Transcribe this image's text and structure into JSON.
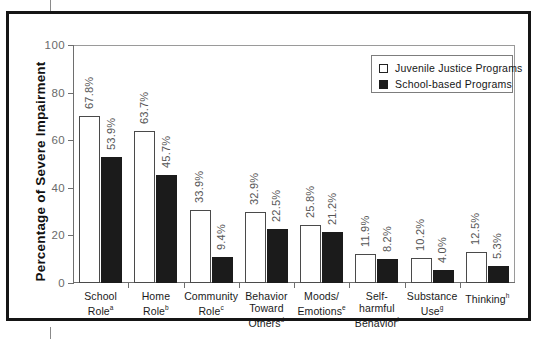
{
  "figure": {
    "ylabel": "Percentage of Severe Impairment"
  },
  "legend": {
    "items": [
      {
        "label": "Juvenile Justice Programs",
        "swatch": "hollow-square",
        "color": "#ffffff"
      },
      {
        "label": "School-based Programs",
        "swatch": "filled-square",
        "color": "#1b1b1b"
      }
    ]
  },
  "axis": {
    "yticks": [
      "0",
      "20",
      "40",
      "60",
      "80",
      "100"
    ]
  },
  "categories": [
    {
      "line1": "School",
      "line2": "Role",
      "line3": "",
      "sup": "a"
    },
    {
      "line1": "Home",
      "line2": "Role",
      "line3": "",
      "sup": "b"
    },
    {
      "line1": "Community",
      "line2": "Role",
      "line3": "",
      "sup": "c"
    },
    {
      "line1": "Behavior",
      "line2": "Toward",
      "line3": "Others",
      "sup": "d"
    },
    {
      "line1": "Moods/",
      "line2": "Emotions",
      "line3": "",
      "sup": "e"
    },
    {
      "line1": "Self-",
      "line2": "harmful",
      "line3": "Behavior",
      "sup": "f"
    },
    {
      "line1": "Substance",
      "line2": "Use",
      "line3": "",
      "sup": "g"
    },
    {
      "line1": "Thinking",
      "line2": "",
      "line3": "",
      "sup": "h"
    }
  ],
  "bar_labels": {
    "jj": [
      "67.8%",
      "63.7%",
      "33.9%",
      "32.9%",
      "25.8%",
      "11.9%",
      "10.2%",
      "12.5%"
    ],
    "sb": [
      "53.9%",
      "45.7%",
      "9.4%",
      "22.5%",
      "21.2%",
      "8.2%",
      "4.0%",
      "5.3%"
    ]
  },
  "chart_data": {
    "type": "bar",
    "title": "",
    "xlabel": "",
    "ylabel": "Percentage of Severe Impairment",
    "ylim": [
      0,
      100
    ],
    "yticks": [
      0,
      20,
      40,
      60,
      80,
      100
    ],
    "grid": false,
    "legend_position": "top-right",
    "categories": [
      "School Role",
      "Home Role",
      "Community Role",
      "Behavior Toward Others",
      "Moods/Emotions",
      "Self-harmful Behavior",
      "Substance Use",
      "Thinking"
    ],
    "category_footnotes": [
      "a",
      "b",
      "c",
      "d",
      "e",
      "f",
      "g",
      "h"
    ],
    "series": [
      {
        "name": "Juvenile Justice Programs",
        "color": "#ffffff",
        "edgecolor": "#4a4a4a",
        "values": [
          67.8,
          63.7,
          33.9,
          32.9,
          25.8,
          11.9,
          10.2,
          12.5
        ],
        "labels": [
          "67.8%",
          "63.7%",
          "33.9%",
          "32.9%",
          "25.8%",
          "11.9%",
          "10.2%",
          "12.5%"
        ],
        "drawn_heights": [
          70.0,
          64.0,
          30.5,
          30.0,
          24.5,
          12.0,
          10.5,
          13.0
        ]
      },
      {
        "name": "School-based Programs",
        "color": "#1b1b1b",
        "edgecolor": "#1b1b1b",
        "values": [
          53.9,
          45.7,
          9.4,
          22.5,
          21.2,
          8.2,
          4.0,
          5.3
        ],
        "labels": [
          "53.9%",
          "45.7%",
          "9.4%",
          "22.5%",
          "21.2%",
          "8.2%",
          "4.0%",
          "5.3%"
        ],
        "drawn_heights": [
          53.0,
          45.5,
          11.0,
          22.5,
          21.5,
          10.0,
          5.5,
          7.0
        ]
      }
    ]
  }
}
